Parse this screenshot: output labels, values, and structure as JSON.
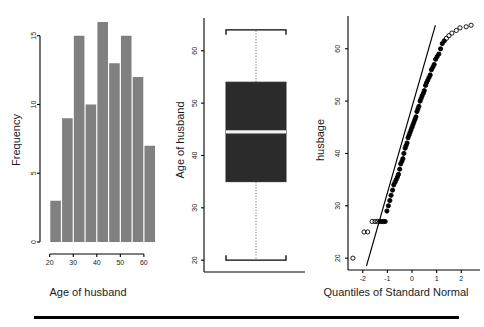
{
  "figure": {
    "background_color": "#ffffff",
    "bar_color": "#808080",
    "box_color": "#2b2b2b",
    "median_color": "#f2f2f2",
    "axis_color": "#000000",
    "panel_count": 3
  },
  "panels": {
    "histogram": {
      "name": "Histogram of husband age",
      "xlabel": "Age of husband",
      "ylabel": "Frequency",
      "xticks": [
        "20",
        "30",
        "40",
        "50",
        "60"
      ],
      "yticks": [
        "0",
        "5",
        "10",
        "15"
      ]
    },
    "boxplot": {
      "name": "Boxplot of husband age",
      "ylabel": "Age of husband",
      "yticks": [
        "20",
        "30",
        "40",
        "50",
        "60"
      ]
    },
    "qqplot": {
      "name": "Normal Q-Q plot of husband age",
      "xlabel": "Quantiles of Standard Normal",
      "ylabel": "husbage",
      "xticks": [
        "-2",
        "-1",
        "0",
        "1",
        "2"
      ],
      "yticks": [
        "20",
        "30",
        "40",
        "50",
        "60"
      ]
    }
  },
  "chart_data": [
    {
      "type": "bar",
      "title": "Histogram of husband age",
      "xlabel": "Age of husband",
      "ylabel": "Frequency",
      "categories": [
        "20-25",
        "25-30",
        "30-35",
        "35-40",
        "40-45",
        "45-50",
        "50-55",
        "55-60",
        "60-65"
      ],
      "bin_edges": [
        20,
        25,
        30,
        35,
        40,
        45,
        50,
        55,
        60,
        65
      ],
      "values": [
        3,
        9,
        15,
        10,
        16,
        13,
        15,
        12,
        7
      ],
      "xlim": [
        18,
        66
      ],
      "ylim": [
        0,
        16
      ],
      "xticks": [
        20,
        30,
        40,
        50,
        60
      ],
      "yticks": [
        0,
        5,
        10,
        15
      ],
      "grid": false,
      "legend": "none"
    },
    {
      "type": "box",
      "title": "Boxplot of husband age",
      "xlabel": "",
      "ylabel": "Age of husband",
      "categories": [
        "husband age"
      ],
      "box": {
        "min": 20,
        "q1": 35,
        "median": 44.5,
        "q3": 54,
        "max": 64
      },
      "ylim": [
        18.5,
        65.5
      ],
      "yticks": [
        20,
        30,
        40,
        50,
        60
      ],
      "outliers": [],
      "grid": false,
      "legend": "none"
    },
    {
      "type": "scatter",
      "title": "Normal Q-Q plot of husband age",
      "xlabel": "Quantiles of Standard Normal",
      "ylabel": "husbage",
      "xlim": [
        -2.6,
        2.6
      ],
      "ylim": [
        18.5,
        65.5
      ],
      "xticks": [
        -2,
        -1,
        0,
        1,
        2
      ],
      "yticks": [
        20,
        30,
        40,
        50,
        60
      ],
      "grid": false,
      "legend": "none",
      "reference_line": {
        "x": [
          -1.85,
          0.95
        ],
        "y": [
          18.5,
          64.5
        ]
      },
      "x": [
        -2.4,
        -1.95,
        -1.8,
        -1.62,
        -1.5,
        -1.4,
        -1.31,
        -1.23,
        -1.16,
        -1.09,
        -1.02,
        -0.96,
        -0.9,
        -0.85,
        -0.79,
        -0.74,
        -0.69,
        -0.64,
        -0.59,
        -0.55,
        -0.5,
        -0.46,
        -0.41,
        -0.37,
        -0.33,
        -0.28,
        -0.24,
        -0.2,
        -0.16,
        -0.12,
        -0.08,
        -0.04,
        0.0,
        0.04,
        0.08,
        0.12,
        0.16,
        0.2,
        0.24,
        0.28,
        0.33,
        0.37,
        0.41,
        0.46,
        0.5,
        0.55,
        0.59,
        0.64,
        0.69,
        0.74,
        0.79,
        0.85,
        0.9,
        0.96,
        1.02,
        1.09,
        1.16,
        1.23,
        1.31,
        1.4,
        1.5,
        1.62,
        1.8,
        1.95,
        2.2,
        2.4
      ],
      "y": [
        20,
        25,
        25,
        27,
        27,
        27,
        27,
        27,
        27,
        27,
        29,
        30,
        31,
        32,
        33,
        34,
        34.5,
        35,
        35.5,
        36,
        37,
        38,
        38.5,
        39,
        40,
        41,
        41.5,
        42,
        43,
        43.5,
        44,
        44.5,
        45,
        45.5,
        46,
        46.5,
        47,
        48,
        48.5,
        49,
        50,
        50.5,
        51,
        51.5,
        52,
        53,
        53.5,
        54,
        54.5,
        55,
        56,
        56.5,
        57,
        58,
        58.5,
        59,
        60,
        61,
        61.5,
        62,
        62.5,
        63,
        63.5,
        64,
        64.2,
        64.5
      ]
    }
  ]
}
